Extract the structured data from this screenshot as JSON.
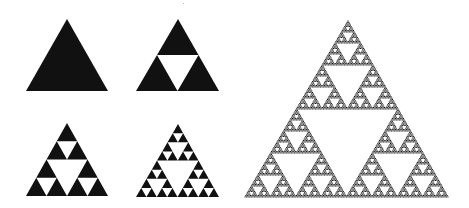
{
  "figure": {
    "background": "#ffffff",
    "fill_color": "#111111",
    "dot_color": "#1a1a1a",
    "panels": [
      {
        "name": "sierpinski-order-0",
        "order": 0,
        "style": "solid",
        "apex": [
          67,
          19
        ],
        "left": [
          26,
          91
        ],
        "right": [
          108,
          91
        ]
      },
      {
        "name": "sierpinski-order-1",
        "order": 1,
        "style": "solid",
        "apex": [
          178,
          19
        ],
        "left": [
          136,
          91
        ],
        "right": [
          219,
          91
        ]
      },
      {
        "name": "sierpinski-order-2",
        "order": 2,
        "style": "solid",
        "apex": [
          67,
          123
        ],
        "left": [
          26,
          196
        ],
        "right": [
          108,
          196
        ]
      },
      {
        "name": "sierpinski-order-3",
        "order": 3,
        "style": "solid",
        "apex": [
          178,
          124
        ],
        "left": [
          136,
          197
        ],
        "right": [
          219,
          197
        ]
      },
      {
        "name": "sierpinski-order-7-dotted",
        "order": 6,
        "style": "dotted",
        "apex": [
          348,
          21
        ],
        "left": [
          245,
          197
        ],
        "right": [
          448,
          197
        ]
      }
    ]
  }
}
